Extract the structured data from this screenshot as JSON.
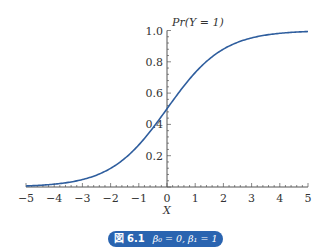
{
  "chart_data": {
    "type": "line",
    "title": "",
    "xlabel": "X",
    "ylabel": "Pr(Y = 1)",
    "xlim": [
      -5,
      5
    ],
    "ylim": [
      0,
      1.0
    ],
    "grid": false,
    "x_ticks": [
      "−5",
      "−4",
      "−3",
      "−2",
      "−1",
      "0",
      "1",
      "2",
      "3",
      "4",
      "5"
    ],
    "y_ticks": [
      "0.2",
      "0.4",
      "0.6",
      "0.8",
      "1.0"
    ],
    "series": [
      {
        "name": "logistic (β0 = 0, β1 = 1)",
        "function": "1/(1+exp(-(0+1*X)))",
        "x": [
          -5,
          -4,
          -3,
          -2,
          -1,
          0,
          1,
          2,
          3,
          4,
          5
        ],
        "values": [
          0.007,
          0.018,
          0.047,
          0.119,
          0.269,
          0.5,
          0.731,
          0.881,
          0.953,
          0.982,
          0.993
        ],
        "color": "#2f5e9e"
      }
    ],
    "caption": "図 6.1  β0 = 0,  β1 = 1"
  },
  "caption": {
    "figure_label": "図 6.1",
    "formula": "β₀ = 0,  β₁ = 1"
  },
  "colors": {
    "curve": "#2f5e9e",
    "axis": "#555555",
    "caption_bg": "#2a64b0",
    "caption_text": "#ffffff"
  }
}
